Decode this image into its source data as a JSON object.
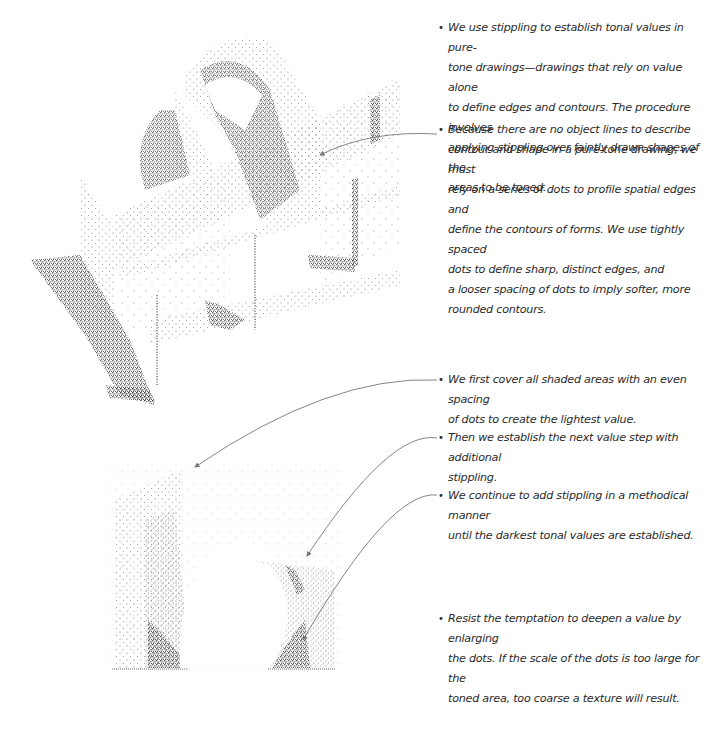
{
  "annotations": {
    "intro": {
      "bullet": "•",
      "lines": [
        "We use stippling to establish tonal values in pure-",
        "tone drawings—drawings that rely on value alone",
        "to define edges and contours. The procedure involves",
        "applying stippling over faintly drawn shapes of the",
        "areas to be toned."
      ]
    },
    "edges": {
      "bullet": "•",
      "lines": [
        "Because there are no object lines to describe",
        "contour and shape in a pure-tone drawing, we must",
        "rely on a series of dots to profile spatial edges and",
        "define the contours of forms. We use tightly spaced",
        "dots to define sharp, distinct edges, and",
        "a looser spacing of dots to imply softer, more",
        "rounded contours."
      ]
    },
    "step1": {
      "bullet": "•",
      "lines": [
        "We first cover all shaded areas with an even spacing",
        "of dots to create the lightest value."
      ]
    },
    "step2": {
      "bullet": "•",
      "lines": [
        "Then we establish the next value step with additional",
        "stippling."
      ]
    },
    "step3": {
      "bullet": "•",
      "lines": [
        "We continue to add stippling in a methodical manner",
        "until the darkest tonal values are established."
      ]
    },
    "caution": {
      "bullet": "•",
      "lines": [
        "Resist the temptation to deepen a value by enlarging",
        "the dots. If the scale of the dots is too large for the",
        "toned area, too coarse a texture will result."
      ]
    }
  },
  "illustrations": {
    "top": "stippled-axonometric-composition",
    "bottom": "stippled-arch-value-study"
  },
  "colors": {
    "ink": "#2b2b2b",
    "stipple_dark": "#333333",
    "stipple_light": "#8a8a8a",
    "leader_line": "#777777"
  }
}
